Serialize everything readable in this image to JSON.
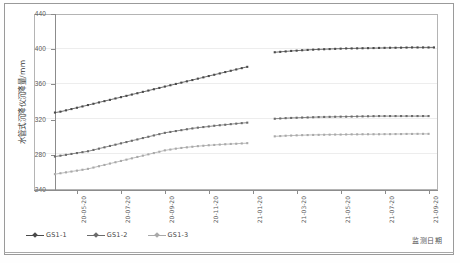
{
  "chart_data": {
    "type": "line",
    "title": "",
    "xlabel": "监测日期",
    "ylabel": "水管式沉降仪沉降量/mm",
    "ylim": [
      240,
      440
    ],
    "yticks": [
      240,
      280,
      320,
      360,
      400,
      440
    ],
    "grid": true,
    "legend_position": "bottom-left",
    "xticklabels": [
      "20-05-20",
      "20-07-20",
      "20-09-20",
      "20-11-20",
      "21-01-20",
      "21-03-20",
      "21-05-20",
      "21-07-20",
      "21-09-20"
    ],
    "x_tick_index": [
      4,
      12,
      20,
      28,
      36,
      44,
      52,
      60,
      68
    ],
    "data_gap": {
      "from_index": 35,
      "to_index": 39,
      "note": "missing data segment between 20-12 and 21-01"
    },
    "series": [
      {
        "name": "GS1-1",
        "color": "#4a4a4a",
        "marker": "square",
        "values": [
          328,
          329,
          330.5,
          332,
          333.5,
          335,
          336.5,
          338,
          339.5,
          341,
          342.5,
          344,
          345.5,
          347,
          348.5,
          350,
          351.5,
          353,
          354.5,
          356,
          357.5,
          359,
          360.5,
          362,
          363.5,
          365,
          366.5,
          368,
          369.5,
          371,
          372.5,
          374,
          375.5,
          377,
          378.5,
          380,
          null,
          null,
          null,
          null,
          396.5,
          397,
          397.5,
          398,
          398.4,
          398.8,
          399.2,
          399.5,
          399.8,
          400,
          400.2,
          400.4,
          400.6,
          400.8,
          400.9,
          401,
          401.1,
          401.2,
          401.3,
          401.4,
          401.5,
          401.6,
          401.7,
          401.8,
          401.9,
          402,
          402,
          402,
          402,
          402
        ]
      },
      {
        "name": "GS1-2",
        "color": "#6b6b6b",
        "marker": "square",
        "values": [
          278,
          279,
          280,
          281,
          282,
          283,
          284,
          285.5,
          287,
          288.5,
          290,
          291.5,
          293,
          294.5,
          296,
          297.5,
          299,
          300.5,
          302,
          303.5,
          305,
          306,
          307,
          308,
          309,
          310,
          310.8,
          311.5,
          312.2,
          313,
          313.6,
          314.2,
          314.8,
          315.4,
          316,
          316.5,
          null,
          null,
          null,
          null,
          321,
          321.3,
          321.6,
          321.9,
          322.1,
          322.3,
          322.5,
          322.7,
          322.9,
          323,
          323.1,
          323.2,
          323.3,
          323.4,
          323.5,
          323.6,
          323.7,
          323.8,
          323.9,
          324,
          324,
          324,
          324,
          324,
          324,
          324,
          324,
          324,
          324
        ]
      },
      {
        "name": "GS1-3",
        "color": "#a9a9a9",
        "marker": "square",
        "values": [
          258,
          259,
          260,
          261,
          262,
          263,
          264,
          265.5,
          267,
          268.5,
          270,
          271.5,
          273,
          274.5,
          276,
          277.5,
          279,
          280.5,
          282,
          283.5,
          285,
          286,
          287,
          287.8,
          288.5,
          289.2,
          289.8,
          290.3,
          290.8,
          291.2,
          291.6,
          292,
          292.3,
          292.6,
          292.9,
          293.2,
          null,
          null,
          null,
          null,
          301,
          301.3,
          301.6,
          301.9,
          302.1,
          302.3,
          302.5,
          302.6,
          302.7,
          302.8,
          302.9,
          303,
          303,
          303.1,
          303.2,
          303.2,
          303.3,
          303.3,
          303.4,
          303.4,
          303.5,
          303.5,
          303.6,
          303.6,
          303.7,
          303.7,
          303.8,
          303.8,
          303.8
        ]
      }
    ]
  },
  "legend": {
    "items": [
      {
        "label": "GS1-1",
        "color": "#4a4a4a"
      },
      {
        "label": "GS1-2",
        "color": "#6b6b6b"
      },
      {
        "label": "GS1-3",
        "color": "#a9a9a9"
      }
    ]
  },
  "axes": {
    "y_title": "水管式沉降仪沉降量/mm",
    "x_title": "监测日期",
    "y_ticks": [
      "440",
      "400",
      "360",
      "320",
      "280",
      "240"
    ],
    "x_ticks": [
      "20-05-20",
      "20-07-20",
      "20-09-20",
      "20-11-20",
      "21-01-20",
      "21-03-20",
      "21-05-20",
      "21-07-20",
      "21-09-20"
    ]
  }
}
